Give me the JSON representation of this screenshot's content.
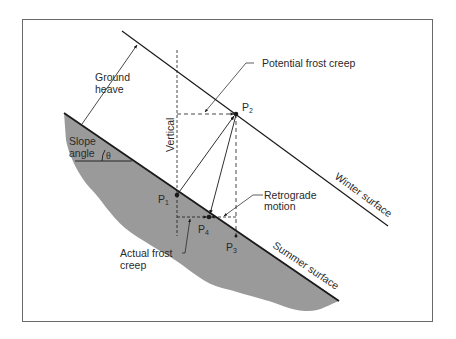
{
  "diagram": {
    "type": "frost-creep-schematic",
    "labels": {
      "ground_heave_1": "Ground",
      "ground_heave_2": "heave",
      "potential_frost_creep": "Potential frost creep",
      "slope_angle_1": "Slope",
      "slope_angle_2": "angle",
      "theta": "θ",
      "vertical": "Vertical",
      "retrograde_1": "Retrograde",
      "retrograde_2": "motion",
      "actual_frost_creep_1": "Actual frost",
      "actual_frost_creep_2": "creep",
      "winter_surface": "Winter surface",
      "summer_surface": "Summer surface"
    },
    "points": {
      "p1": {
        "letter": "P",
        "sub": "1"
      },
      "p2": {
        "letter": "P",
        "sub": "2"
      },
      "p3": {
        "letter": "P",
        "sub": "3"
      },
      "p4": {
        "letter": "P",
        "sub": "4"
      }
    },
    "colors": {
      "ground_fill": "#9a9a9a",
      "line": "#1a1a1a",
      "frame": "#6a6a6a",
      "text": "#2a2a2a"
    }
  }
}
